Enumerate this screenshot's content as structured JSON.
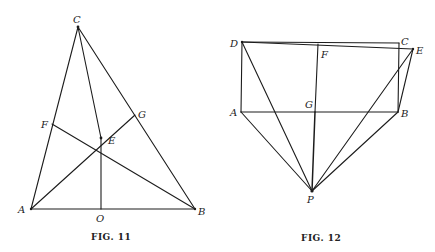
{
  "figures": [
    {
      "caption": "FIG. 11",
      "points": {
        "A": {
          "label": "A",
          "x": 31,
          "y": 209
        },
        "B": {
          "label": "B",
          "x": 195,
          "y": 209
        },
        "C": {
          "label": "C",
          "x": 78,
          "y": 27
        },
        "E": {
          "label": "E",
          "x": 101,
          "y": 138
        },
        "F": {
          "label": "F",
          "x": 52,
          "y": 124
        },
        "G": {
          "label": "G",
          "x": 135,
          "y": 115
        },
        "O": {
          "label": "O",
          "x": 101,
          "y": 209
        }
      },
      "segments": [
        "A-B",
        "A-C",
        "B-C",
        "C-E",
        "E-O",
        "A-G",
        "F-B"
      ]
    },
    {
      "caption": "FIG. 12",
      "points": {
        "A": {
          "label": "A",
          "x": 241,
          "y": 112
        },
        "B": {
          "label": "B",
          "x": 398,
          "y": 112
        },
        "C": {
          "label": "C",
          "x": 399,
          "y": 43
        },
        "D": {
          "label": "D",
          "x": 242,
          "y": 42
        },
        "E": {
          "label": "E",
          "x": 413,
          "y": 49
        },
        "F": {
          "label": "F",
          "x": 318,
          "y": 47
        },
        "G": {
          "label": "G",
          "x": 315,
          "y": 112
        },
        "P": {
          "label": "P",
          "x": 312,
          "y": 191
        }
      },
      "segments": [
        "D-C",
        "C-B",
        "A-B",
        "D-A",
        "D-E",
        "E-B",
        "F-G",
        "G-P",
        "A-P",
        "D-P",
        "E-P",
        "B-P"
      ]
    }
  ]
}
